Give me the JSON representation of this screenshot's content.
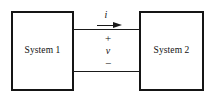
{
  "figure": {
    "kind": "two-terminal port interconnection diagram",
    "background_color": "#ffffff",
    "line_color": "#1a1a1a"
  },
  "blocks": {
    "left": {
      "label": "System 1"
    },
    "right": {
      "label": "System 2"
    }
  },
  "port": {
    "current_label": "i",
    "current_direction": "right",
    "voltage_label": "v",
    "polarity_plus": "+",
    "polarity_minus": "−"
  }
}
